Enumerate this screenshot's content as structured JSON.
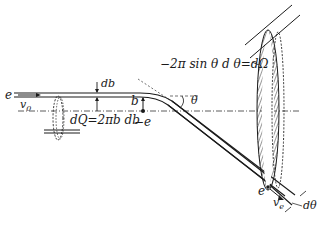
{
  "diagram": {
    "type": "scattering-geometry",
    "labels": {
      "incoming_charge": "e",
      "incoming_velocity": "v",
      "incoming_velocity_sub": "0",
      "db": "db",
      "impact_parameter": "b",
      "target_charge": "−e",
      "ring_area": "dQ=2πb db",
      "angle": "θ",
      "solid_angle": "−2π sin θ d θ=dΩ",
      "outgoing_charge": "e",
      "outgoing_velocity": "v",
      "outgoing_velocity_sub": "e",
      "dtheta": "dθ"
    },
    "colors": {
      "line": "#1a1a1a",
      "background": "#ffffff"
    }
  }
}
